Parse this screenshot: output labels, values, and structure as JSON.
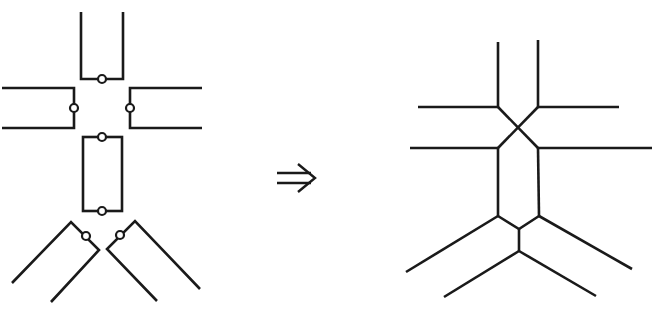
{
  "diagram": {
    "colors": {
      "stroke": "#1a1a1a",
      "background": "#ffffff",
      "port_fill": "#ffffff"
    },
    "left": {
      "label": "Separate pieces with gluing ports",
      "pieces": [
        {
          "name": "top-u",
          "points": [
            [
              81,
              12
            ],
            [
              81,
              79
            ],
            [
              123,
              79
            ],
            [
              123,
              12
            ]
          ],
          "ports": [
            [
              102,
              79
            ]
          ]
        },
        {
          "name": "left-bracket",
          "points": [
            [
              2,
              88
            ],
            [
              74,
              88
            ],
            [
              74,
              128
            ],
            [
              2,
              128
            ]
          ],
          "ports": [
            [
              74,
              108
            ]
          ]
        },
        {
          "name": "right-bracket",
          "points": [
            [
              202,
              88
            ],
            [
              130,
              88
            ],
            [
              130,
              128
            ],
            [
              202,
              128
            ]
          ],
          "ports": [
            [
              130,
              108
            ]
          ]
        },
        {
          "name": "middle-rect",
          "rect": [
            83,
            137,
            122,
            211
          ],
          "ports": [
            [
              102,
              137
            ],
            [
              102,
              211
            ]
          ]
        },
        {
          "name": "lower-left-v",
          "points": [
            [
              12,
              283
            ],
            [
              71,
              222
            ],
            [
              99,
              250
            ],
            [
              51,
              302
            ]
          ],
          "ports": [
            [
              86,
              235
            ]
          ]
        },
        {
          "name": "lower-right-v",
          "points": [
            [
              200,
              289
            ],
            [
              135,
              221
            ],
            [
              107,
              249
            ],
            [
              157,
              301
            ]
          ],
          "ports": [
            [
              120,
              235
            ]
          ]
        }
      ]
    },
    "arrow": {
      "symbol": "⇒",
      "label": "implies / maps to"
    },
    "right": {
      "label": "Resulting glued graph",
      "segments": [
        {
          "name": "top-left-vertical",
          "points": [
            [
              498,
              42
            ],
            [
              498,
              107
            ]
          ]
        },
        {
          "name": "top-right-vertical",
          "points": [
            [
              538,
              40
            ],
            [
              538,
              107
            ]
          ]
        },
        {
          "name": "upper-left-horizontal",
          "points": [
            [
              418,
              107
            ],
            [
              498,
              107
            ]
          ]
        },
        {
          "name": "upper-right-horizontal",
          "points": [
            [
              538,
              107
            ],
            [
              619,
              107
            ]
          ]
        },
        {
          "name": "cross-diagonal-a",
          "points": [
            [
              498,
              107
            ],
            [
              538,
              148
            ]
          ]
        },
        {
          "name": "cross-diagonal-b",
          "points": [
            [
              538,
              107
            ],
            [
              498,
              148
            ]
          ]
        },
        {
          "name": "lower-left-horizontal",
          "points": [
            [
              410,
              148
            ],
            [
              498,
              148
            ]
          ]
        },
        {
          "name": "lower-right-horizontal",
          "points": [
            [
              538,
              148
            ],
            [
              652,
              148
            ]
          ]
        },
        {
          "name": "middle-left-vertical",
          "points": [
            [
              498,
              148
            ],
            [
              498,
              216
            ]
          ]
        },
        {
          "name": "middle-right-vertical",
          "points": [
            [
              538,
              148
            ],
            [
              539,
              216
            ]
          ]
        },
        {
          "name": "outer-left-diagonal",
          "points": [
            [
              498,
              216
            ],
            [
              406,
              272
            ]
          ]
        },
        {
          "name": "outer-right-diagonal",
          "points": [
            [
              539,
              216
            ],
            [
              632,
              269
            ]
          ]
        },
        {
          "name": "inner-left-join",
          "points": [
            [
              498,
              216
            ],
            [
              519,
              229
            ]
          ]
        },
        {
          "name": "inner-right-join",
          "points": [
            [
              539,
              216
            ],
            [
              519,
              229
            ]
          ]
        },
        {
          "name": "stem-vertical",
          "points": [
            [
              519,
              229
            ],
            [
              519,
              251
            ]
          ]
        },
        {
          "name": "lower-left-diagonal",
          "points": [
            [
              519,
              251
            ],
            [
              444,
              297
            ]
          ]
        },
        {
          "name": "lower-right-diagonal",
          "points": [
            [
              519,
              251
            ],
            [
              596,
              296
            ]
          ]
        }
      ]
    }
  }
}
